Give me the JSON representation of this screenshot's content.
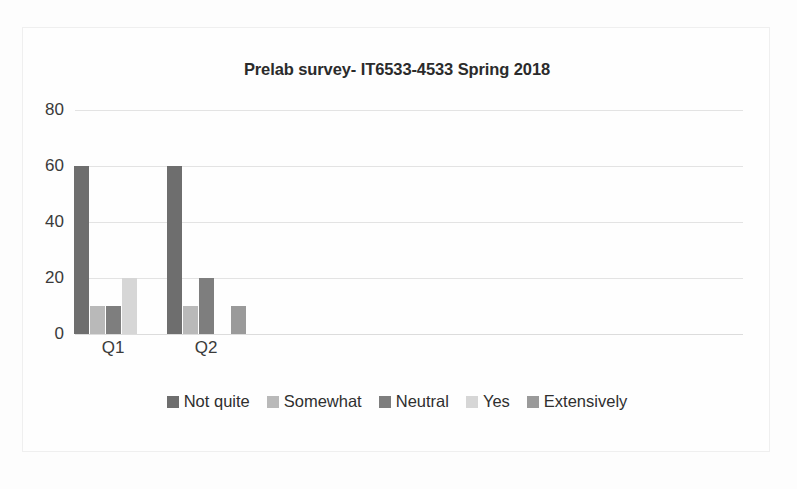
{
  "chart_data": {
    "type": "bar",
    "title": "Prelab survey- IT6533-4533 Spring 2018",
    "xlabel": "",
    "ylabel": "",
    "categories": [
      "Q1",
      "Q2"
    ],
    "series": [
      {
        "name": "Not quite",
        "values": [
          60,
          60
        ],
        "color": "#6e6e6e"
      },
      {
        "name": "Somewhat",
        "values": [
          10,
          10
        ],
        "color": "#b9b9b9"
      },
      {
        "name": "Neutral",
        "values": [
          10,
          20
        ],
        "color": "#7e7e7e"
      },
      {
        "name": "Yes",
        "values": [
          20,
          0
        ],
        "color": "#d6d6d6"
      },
      {
        "name": "Extensively",
        "values": [
          0,
          10
        ],
        "color": "#9a9a9a"
      }
    ],
    "ylim": [
      0,
      80
    ],
    "yticks": [
      0,
      20,
      40,
      60,
      80
    ],
    "ytick_labels": [
      "0",
      "20",
      "40",
      "60",
      "80"
    ],
    "grid": true,
    "legend_position": "bottom"
  }
}
